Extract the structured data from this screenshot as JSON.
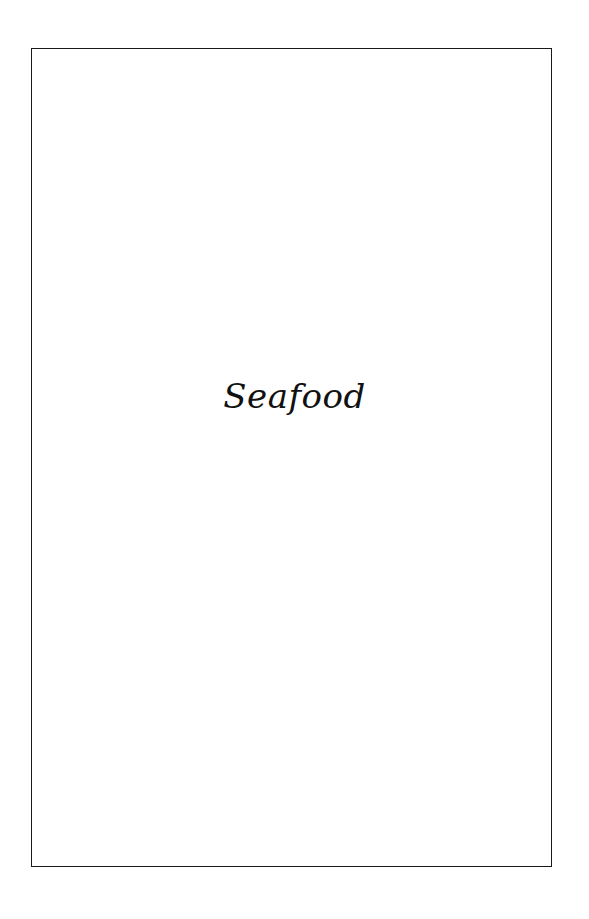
{
  "page": {
    "section_title": "Seafood"
  }
}
